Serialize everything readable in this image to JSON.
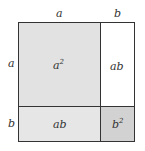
{
  "diagram": {
    "top_labels": [
      "a",
      "b"
    ],
    "side_labels": [
      "a",
      "b"
    ],
    "regions": [
      {
        "id": "a-squared",
        "base": "a",
        "exp": "2",
        "fill": "#e2e2e2"
      },
      {
        "id": "top-right-ab",
        "label": "ab",
        "fill": "#ffffff"
      },
      {
        "id": "bottom-left-ab",
        "label": "ab",
        "fill": "#e6e6e6"
      },
      {
        "id": "b-squared",
        "base": "b",
        "exp": "2",
        "fill": "#d2d2d2"
      }
    ],
    "colors": {
      "stroke": "#333333"
    }
  }
}
